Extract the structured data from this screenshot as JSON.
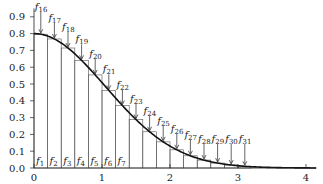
{
  "chart_data": {
    "type": "bar",
    "title": "",
    "xlabel": "",
    "ylabel": "",
    "xlim": [
      0,
      4.15
    ],
    "ylim": [
      0,
      1.0
    ],
    "grid": false,
    "x_ticks": [
      0,
      1,
      2,
      3,
      4
    ],
    "y_ticks": [
      0.0,
      0.1,
      0.2,
      0.3,
      0.4,
      0.5,
      0.6,
      0.7,
      0.8,
      0.9
    ],
    "x_tick_labels": [
      "0",
      "1",
      "2",
      "3",
      "4"
    ],
    "y_tick_labels": [
      "0.0",
      "0.1",
      "0.2",
      "0.3",
      "0.4",
      "0.5",
      "0.6",
      "0.7",
      "0.8",
      "0.9"
    ],
    "curve": {
      "description": "smooth decreasing curve starting at 0.8 at x=0, approaching 0 near x=3, flat to x=4.15",
      "x": [
        0,
        0.5,
        1.0,
        1.5,
        2.0,
        2.5,
        3.0,
        3.5,
        4.0
      ],
      "y": [
        0.8,
        0.71,
        0.49,
        0.28,
        0.14,
        0.06,
        0.02,
        0.0,
        0.0
      ]
    },
    "bars": {
      "width": 0.2,
      "left_edges": [
        0.0,
        0.2,
        0.4,
        0.6,
        0.8,
        1.0,
        1.2,
        1.4,
        1.6,
        1.8,
        2.0,
        2.2,
        2.4,
        2.6,
        2.8,
        3.0
      ],
      "heights": [
        0.79,
        0.74,
        0.67,
        0.59,
        0.49,
        0.4,
        0.31,
        0.24,
        0.17,
        0.12,
        0.08,
        0.05,
        0.03,
        0.02,
        0.01,
        0.005
      ]
    },
    "bottom_labels": [
      "f1",
      "f2",
      "f3",
      "f4",
      "f5",
      "f6",
      "f7"
    ],
    "arrow_labels": [
      "f16",
      "f17",
      "f18",
      "f19",
      "f20",
      "f21",
      "f22",
      "f23",
      "f24",
      "f25",
      "f26",
      "f27",
      "f28",
      "f29",
      "f30",
      "f31"
    ],
    "annotations": "Arrows labeled f16-f31 point down to the midpoint of each bar top; labels f1-f7 sit inside the first seven bars at the base"
  }
}
